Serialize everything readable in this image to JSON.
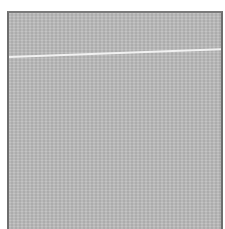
{
  "image": {
    "subject": "gray textured swatch",
    "background_color": "#ffffff",
    "swatch_color": "#bdbdbd",
    "border_color": "#6e6e6e",
    "streak_color": "#f4f4f4"
  }
}
